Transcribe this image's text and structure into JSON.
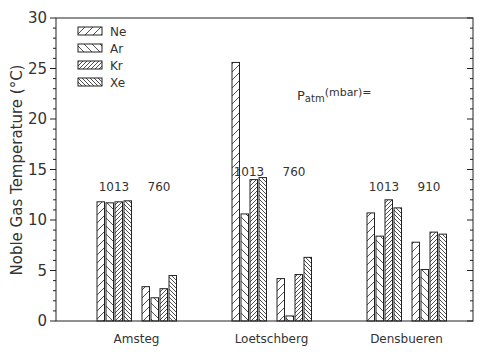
{
  "chart_data": {
    "type": "bar",
    "title": "",
    "xlabel": "",
    "ylabel": "Noble Gas Temperature (°C)",
    "ylim": [
      0,
      30
    ],
    "yticks": [
      0,
      5,
      10,
      15,
      20,
      25,
      30
    ],
    "grid": false,
    "legend": {
      "position": "top-left",
      "entries": [
        "Ne",
        "Ar",
        "Kr",
        "Xe"
      ]
    },
    "annotation": "Patm(mbar)=",
    "series_names": [
      "Ne",
      "Ar",
      "Kr",
      "Xe"
    ],
    "sites": [
      {
        "name": "Amsteg",
        "groups": [
          {
            "pressure": "1013",
            "values": {
              "Ne": 11.8,
              "Ar": 11.7,
              "Kr": 11.8,
              "Xe": 11.9
            }
          },
          {
            "pressure": "760",
            "values": {
              "Ne": 3.4,
              "Ar": 2.3,
              "Kr": 3.2,
              "Xe": 4.5
            }
          }
        ]
      },
      {
        "name": "Loetschberg",
        "groups": [
          {
            "pressure": "1013",
            "values": {
              "Ne": 25.6,
              "Ar": 10.6,
              "Kr": 14.0,
              "Xe": 14.2
            }
          },
          {
            "pressure": "760",
            "values": {
              "Ne": 4.2,
              "Ar": 0.5,
              "Kr": 4.6,
              "Xe": 6.3
            }
          }
        ]
      },
      {
        "name": "Densbueren",
        "groups": [
          {
            "pressure": "1013",
            "values": {
              "Ne": 10.7,
              "Ar": 8.4,
              "Kr": 12.0,
              "Xe": 11.2
            }
          },
          {
            "pressure": "910",
            "values": {
              "Ne": 7.8,
              "Ar": 5.1,
              "Kr": 8.8,
              "Xe": 8.6
            }
          }
        ]
      }
    ],
    "categories": [
      "Amsteg 1013",
      "Amsteg 760",
      "Loetschberg 1013",
      "Loetschberg 760",
      "Densbueren 1013",
      "Densbueren 910"
    ],
    "series": [
      {
        "name": "Ne",
        "values": [
          11.8,
          3.4,
          25.6,
          4.2,
          10.7,
          7.8
        ]
      },
      {
        "name": "Ar",
        "values": [
          11.7,
          2.3,
          10.6,
          0.5,
          8.4,
          5.1
        ]
      },
      {
        "name": "Kr",
        "values": [
          11.8,
          3.2,
          14.0,
          4.6,
          12.0,
          8.8
        ]
      },
      {
        "name": "Xe",
        "values": [
          11.9,
          4.5,
          14.2,
          6.3,
          11.2,
          8.6
        ]
      }
    ]
  },
  "colors": {
    "axis": "#222222",
    "text": "#333333",
    "bar_fill": "#ffffff"
  }
}
